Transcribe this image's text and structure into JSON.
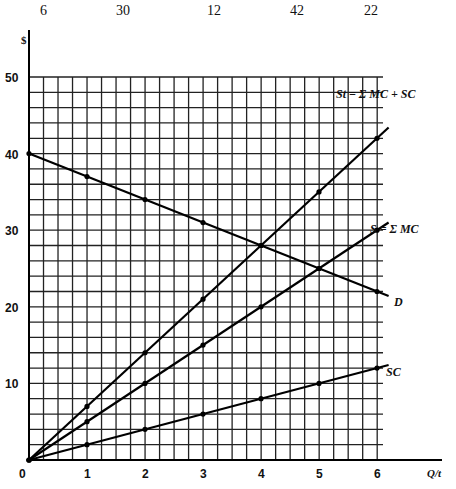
{
  "header_numbers": [
    "6",
    "30",
    "12",
    "42",
    "22"
  ],
  "chart_data": {
    "type": "line",
    "title": "",
    "xlabel": "Q/t",
    "ylabel": "$",
    "xlim": [
      0,
      6
    ],
    "ylim": [
      0,
      50
    ],
    "x_ticks": [
      "0",
      "1",
      "2",
      "3",
      "4",
      "5",
      "6"
    ],
    "y_ticks": [
      "10",
      "20",
      "30",
      "40",
      "50"
    ],
    "grid": true,
    "series": [
      {
        "name": "D",
        "label": "D",
        "x": [
          0,
          1,
          2,
          3,
          4,
          5,
          6
        ],
        "y": [
          40,
          37,
          34,
          31,
          28,
          25,
          22
        ]
      },
      {
        "name": "S_t",
        "label": "St = Σ MC + SC",
        "x": [
          0,
          1,
          2,
          3,
          4,
          5,
          6
        ],
        "y": [
          0,
          7,
          14,
          21,
          28,
          35,
          42
        ]
      },
      {
        "name": "S",
        "label": "S = Σ MC",
        "x": [
          0,
          1,
          2,
          3,
          4,
          5,
          6
        ],
        "y": [
          0,
          5,
          10,
          15,
          20,
          25,
          30
        ]
      },
      {
        "name": "SC",
        "label": "SC",
        "x": [
          0,
          1,
          2,
          3,
          4,
          5,
          6
        ],
        "y": [
          0,
          2,
          4,
          6,
          8,
          10,
          12
        ]
      }
    ]
  }
}
